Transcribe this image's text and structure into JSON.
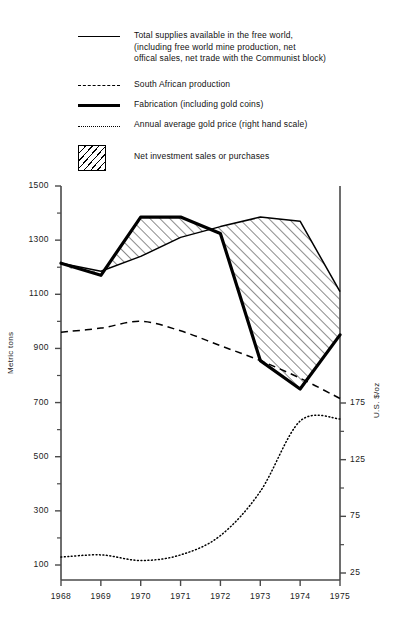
{
  "legend": {
    "items": [
      {
        "key": "solid-thin",
        "icon": "solid-line-icon",
        "text": "Total supplies available in the free world,\n(including free world mine production, net\noffical sales, net trade with the Communist block)"
      },
      {
        "key": "dashed",
        "icon": "dashed-line-icon",
        "text": "South African production"
      },
      {
        "key": "solid-thick",
        "icon": "thick-line-icon",
        "text": "Fabrication (including gold coins)"
      },
      {
        "key": "dotted",
        "icon": "dotted-line-icon",
        "text": "Annual average gold price (right hand scale)"
      },
      {
        "key": "hatch",
        "icon": "hatched-swatch-icon",
        "text": "Net investment sales or purchases"
      }
    ]
  },
  "axes": {
    "left_label": "Metric tons",
    "right_label": "U.S. $/oz",
    "left_ticks": [
      "1500",
      "1300",
      "1100",
      "900",
      "700",
      "500",
      "300",
      "100"
    ],
    "left_tick_values": [
      1500,
      1300,
      1100,
      900,
      700,
      500,
      300,
      100
    ],
    "right_ticks": [
      "175",
      "125",
      "75",
      "25"
    ],
    "right_tick_values": [
      175,
      125,
      75,
      25
    ],
    "x_ticks": [
      "1968",
      "1969",
      "1970",
      "1971",
      "1972",
      "1973",
      "1974",
      "1975"
    ]
  },
  "caption": "",
  "colors": {
    "line": "#000000",
    "axis": "#4a4a4a",
    "text": "#1a1a1a",
    "background": "#ffffff"
  },
  "chart_data": {
    "type": "line",
    "title": "",
    "xlabel": "",
    "ylabel": "Metric tons",
    "y2label": "U.S. $/oz",
    "x": [
      1968,
      1969,
      1970,
      1971,
      1972,
      1973,
      1974,
      1975
    ],
    "categories": [
      "1968",
      "1969",
      "1970",
      "1971",
      "1972",
      "1973",
      "1974",
      "1975"
    ],
    "ylim": [
      0,
      1500
    ],
    "y2lim": [
      0,
      200
    ],
    "grid": false,
    "legend_position": "above-plot",
    "series": [
      {
        "name": "Total supplies available in the free world, (including free world mine production, net offical sales, net trade with the Communist block)",
        "style": "solid-thin",
        "axis": "left",
        "values": [
          1215,
          1185,
          1240,
          1310,
          1350,
          1385,
          1370,
          1110
        ]
      },
      {
        "name": "South African production",
        "style": "dashed",
        "axis": "left",
        "values": [
          960,
          975,
          1000,
          965,
          910,
          855,
          790,
          715
        ]
      },
      {
        "name": "Fabrication (including gold coins)",
        "style": "solid-thick",
        "axis": "left",
        "values": [
          1215,
          1170,
          1385,
          1385,
          1325,
          855,
          750,
          950
        ]
      },
      {
        "name": "Annual average gold price (right hand scale)",
        "style": "dotted",
        "axis": "right",
        "values": [
          39,
          41,
          36,
          41,
          58,
          97,
          159,
          161
        ]
      }
    ],
    "shaded_band": {
      "name": "Net investment sales or purchases",
      "style": "hatched",
      "between": [
        "Total supplies available in the free world, (including free world mine production, net offical sales, net trade with the Communist block)",
        "Fabrication (including gold coins)"
      ]
    }
  }
}
